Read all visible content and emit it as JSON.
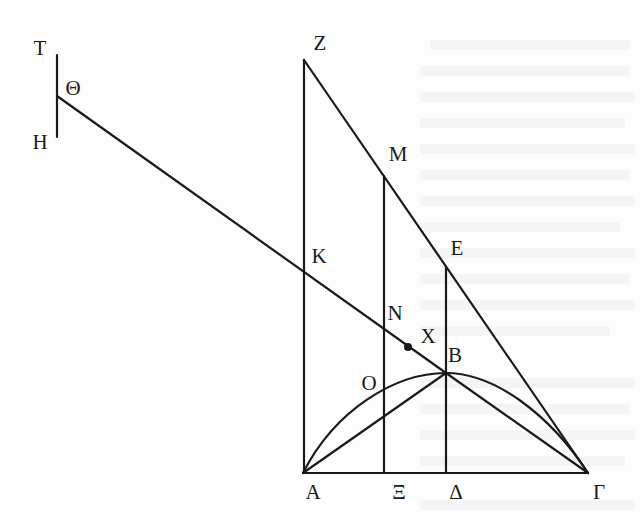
{
  "figure": {
    "stroke_color": "#1a1a1a",
    "background_color": "#ffffff",
    "points": {
      "T": {
        "label": "Τ",
        "x": 40,
        "y": 48
      },
      "Theta": {
        "label": "Θ",
        "x": 73,
        "y": 88
      },
      "H": {
        "label": "Η",
        "x": 40,
        "y": 142
      },
      "Z": {
        "label": "Ζ",
        "x": 320,
        "y": 43
      },
      "M": {
        "label": "Μ",
        "x": 398,
        "y": 154
      },
      "E": {
        "label": "Ε",
        "x": 457,
        "y": 248
      },
      "K": {
        "label": "Κ",
        "x": 319,
        "y": 256
      },
      "N": {
        "label": "Ν",
        "x": 395,
        "y": 313
      },
      "X": {
        "label": "Χ",
        "x": 428,
        "y": 336
      },
      "B": {
        "label": "Β",
        "x": 455,
        "y": 355
      },
      "O": {
        "label": "Ο",
        "x": 369,
        "y": 383
      },
      "A": {
        "label": "Α",
        "x": 313,
        "y": 492
      },
      "Xi": {
        "label": "Ξ",
        "x": 399,
        "y": 492
      },
      "Delta": {
        "label": "Δ",
        "x": 456,
        "y": 492
      },
      "Gamma": {
        "label": "Γ",
        "x": 599,
        "y": 492
      }
    },
    "segments": [
      {
        "name": "segment-TH",
        "from": [
          57,
          55
        ],
        "to": [
          57,
          137
        ]
      },
      {
        "name": "segment-Theta-B",
        "from": [
          57,
          96
        ],
        "to": [
          446,
          373
        ]
      },
      {
        "name": "segment-ZA",
        "from": [
          304,
          60
        ],
        "to": [
          304,
          473
        ]
      },
      {
        "name": "segment-Z-Gamma",
        "from": [
          304,
          60
        ],
        "to": [
          588,
          473
        ]
      },
      {
        "name": "segment-M-Xi",
        "from": [
          384,
          176
        ],
        "to": [
          384,
          473
        ]
      },
      {
        "name": "segment-E-Delta",
        "from": [
          446,
          267
        ],
        "to": [
          446,
          473
        ]
      },
      {
        "name": "segment-A-Gamma",
        "from": [
          303,
          473
        ],
        "to": [
          588,
          473
        ]
      },
      {
        "name": "segment-AB",
        "from": [
          303,
          473
        ],
        "to": [
          446,
          373
        ]
      },
      {
        "name": "segment-B-Gamma",
        "from": [
          446,
          373
        ],
        "to": [
          588,
          473
        ]
      }
    ],
    "curve": {
      "name": "parabolic-arc-A-B-Gamma",
      "path": "M 303 473 C 335 410, 395 373, 446 373 C 495 373, 550 415, 588 473"
    },
    "dot": {
      "name": "point-X-dot",
      "cx": 408,
      "cy": 347,
      "r": 4
    }
  }
}
